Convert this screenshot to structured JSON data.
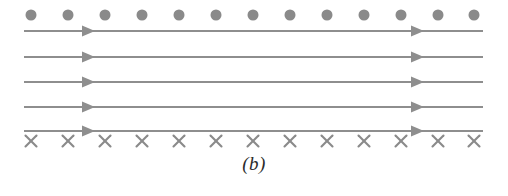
{
  "figure": {
    "caption": "(b)",
    "width": 508,
    "height": 196,
    "background_color": "#ffffff",
    "colors": {
      "dot": "#8a8a8a",
      "cross": "#8a8a8a",
      "line": "#8e8e8e",
      "arrowhead": "#8e8e8e",
      "caption": "#2b2b2b"
    },
    "dot_row": {
      "name": "field-out-of-page-markers",
      "symbol": "dot",
      "count": 13,
      "y": 15,
      "radius": 5.5,
      "x_positions": [
        31,
        68,
        105,
        142,
        179,
        216,
        253,
        290,
        327,
        364,
        401,
        438,
        474
      ]
    },
    "cross_row": {
      "name": "field-into-page-markers",
      "symbol": "cross",
      "glyph": "×",
      "count": 13,
      "y": 141,
      "size": 11,
      "stroke_width": 2.1,
      "x_positions": [
        31,
        68,
        105,
        142,
        179,
        216,
        253,
        290,
        327,
        364,
        401,
        438,
        474
      ]
    },
    "field_lines": {
      "name": "field-lines",
      "count": 5,
      "x_start": 24,
      "x_end": 483,
      "stroke_width": 1.9,
      "direction": "right",
      "y_positions": [
        31,
        57,
        82,
        107,
        131
      ],
      "arrow_x_positions": [
        95,
        424
      ]
    }
  }
}
